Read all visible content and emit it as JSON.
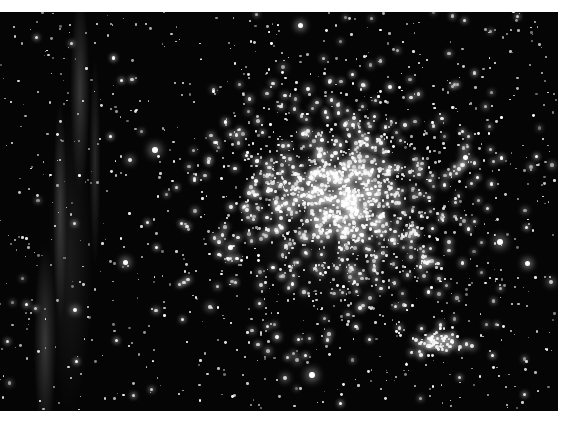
{
  "image": {
    "description": "Dense globular star cluster with a wispy gray nebula filament along the left edge, on a black background",
    "subject": "star-cluster",
    "features": [
      "globular-cluster-core",
      "nebula-filament",
      "background-stars",
      "secondary-star-clump"
    ],
    "colors": {
      "background": "#050505",
      "stars": "#ffffff",
      "nebula": "#969696",
      "border": "#ffffff"
    }
  }
}
